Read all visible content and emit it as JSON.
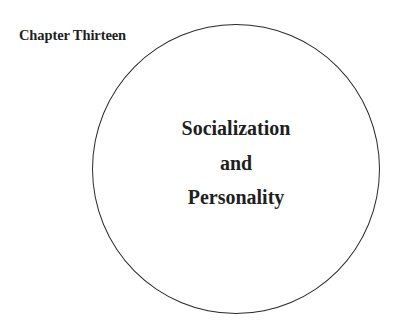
{
  "page": {
    "chapter_label": "Chapter Thirteen",
    "title_lines": [
      "Socialization",
      "and",
      "Personality"
    ]
  },
  "colors": {
    "background": "#ffffff",
    "text": "#1f1f1f",
    "circle_stroke": "#2a2a2a"
  }
}
